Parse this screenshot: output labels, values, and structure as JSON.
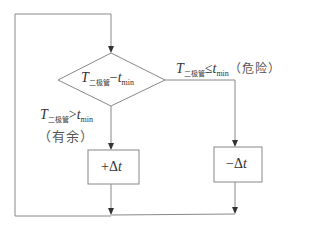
{
  "diagram": {
    "type": "flowchart",
    "decision": {
      "T": "T",
      "T_sub": "二极管",
      "op": "−",
      "t": "t",
      "t_sub": "min"
    },
    "branch_right": {
      "T": "T",
      "T_sub": "二极管",
      "op": "≤",
      "t": "t",
      "t_sub": "min",
      "note": "（危险）"
    },
    "branch_left": {
      "T": "T",
      "T_sub": "二极管",
      "op": ">",
      "t": "t",
      "t_sub": "min",
      "note": "（有余）"
    },
    "box_left": {
      "sign": "+",
      "delta": "Δ",
      "t": "t"
    },
    "box_right": {
      "sign": "−",
      "delta": "Δ",
      "t": "t"
    },
    "colors": {
      "line": "#888888",
      "arrow": "#333333",
      "text": "#333333"
    }
  }
}
